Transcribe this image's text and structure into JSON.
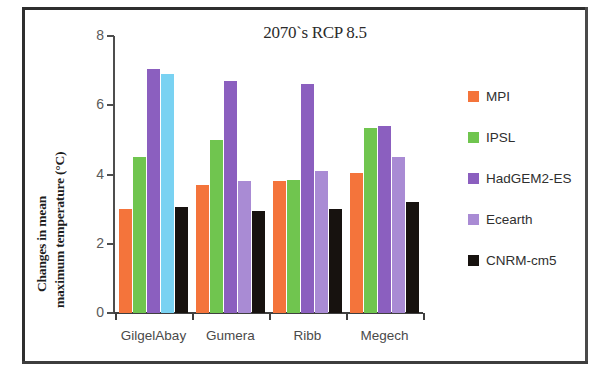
{
  "chart_data": {
    "type": "bar",
    "title": "2070`s RCP 8.5",
    "xlabel": "",
    "ylabel_line1": "Changes in mean",
    "ylabel_line2": "maximum temperature (°C)",
    "ylim": [
      0,
      8
    ],
    "yticks": [
      "0",
      "2",
      "4",
      "6",
      "8"
    ],
    "ytick_values": [
      0,
      2,
      4,
      6,
      8
    ],
    "grid": false,
    "legend_position": "right",
    "categories": [
      "GilgelAbay",
      "Gumera",
      "Ribb",
      "Megech"
    ],
    "series": [
      {
        "name": "MPI",
        "color": "#F4743B",
        "values": [
          3.0,
          3.7,
          3.8,
          4.05
        ]
      },
      {
        "name": "IPSL",
        "color": "#70C54F",
        "values": [
          4.5,
          5.0,
          3.85,
          5.35
        ]
      },
      {
        "name": "HadGEM2-ES",
        "color": "#8B5FBF",
        "values": [
          7.05,
          6.7,
          6.6,
          5.4
        ]
      },
      {
        "name": "Ecearth",
        "color": "#A98BD4",
        "values": [
          6.9,
          3.8,
          4.1,
          4.5
        ]
      },
      {
        "name": "CNRM-cm5",
        "color": "#17120F",
        "values": [
          3.05,
          2.95,
          3.0,
          3.2
        ]
      }
    ],
    "bar_color_overrides": [
      {
        "series": "Ecearth",
        "category": "GilgelAbay",
        "color": "#79D2F2"
      }
    ]
  },
  "legend": {
    "items": [
      {
        "label": "MPI"
      },
      {
        "label": "IPSL"
      },
      {
        "label": "HadGEM2-ES"
      },
      {
        "label": "Ecearth"
      },
      {
        "label": "CNRM-cm5"
      }
    ]
  }
}
